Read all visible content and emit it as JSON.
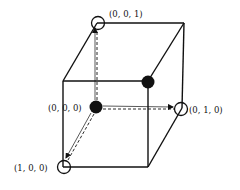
{
  "diagram": {
    "type": "unit-cube-vertices",
    "labels": {
      "origin": "(0, 0, 0)",
      "z_axis": "(0, 0, 1)",
      "y_axis": "(0, 1, 0)",
      "x_axis": "(1, 0, 0)"
    },
    "vertices": [
      {
        "coord": "(0, 0, 0)",
        "marker": "filled"
      },
      {
        "coord": "(0, 0, 1)",
        "marker": "open"
      },
      {
        "coord": "(0, 1, 0)",
        "marker": "open"
      },
      {
        "coord": "(1, 0, 0)",
        "marker": "open"
      },
      {
        "coord": "unlabeled-front-top-right",
        "marker": "filled"
      }
    ],
    "arrows": [
      {
        "from": "(0, 0, 0)",
        "to": "(0, 0, 1)",
        "style": "dashed"
      },
      {
        "from": "(0, 0, 0)",
        "to": "(0, 1, 0)",
        "style": "dashed"
      },
      {
        "from": "(0, 0, 0)",
        "to": "(1, 0, 0)",
        "style": "dashed"
      }
    ]
  }
}
